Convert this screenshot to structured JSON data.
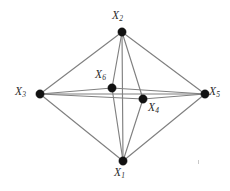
{
  "figure": {
    "type": "undirected-graph-diagram",
    "background_color": "#ffffff",
    "edge_color": "#808080",
    "node_color": "#111111",
    "label_color": "#2b2b2b",
    "width": 230,
    "height": 191
  },
  "nodes": [
    {
      "id": "X1",
      "label_var": "X",
      "label_sub": "1",
      "label_text": "X1",
      "x": 123,
      "y": 161,
      "r": 4.2,
      "label_x": 114,
      "label_y": 167
    },
    {
      "id": "X2",
      "label_var": "X",
      "label_sub": "2",
      "label_text": "X2",
      "x": 122,
      "y": 32,
      "r": 4.2,
      "label_x": 112,
      "label_y": 10
    },
    {
      "id": "X3",
      "label_var": "X",
      "label_sub": "3",
      "label_text": "X3",
      "x": 40,
      "y": 94,
      "r": 4.2,
      "label_x": 15,
      "label_y": 86
    },
    {
      "id": "X4",
      "label_var": "X",
      "label_sub": "4",
      "label_text": "X4",
      "x": 143,
      "y": 99,
      "r": 4.2,
      "label_x": 148,
      "label_y": 102
    },
    {
      "id": "X5",
      "label_var": "X",
      "label_sub": "5",
      "label_text": "X5",
      "x": 205,
      "y": 94,
      "r": 4.2,
      "label_x": 209,
      "label_y": 86
    },
    {
      "id": "X6",
      "label_var": "X",
      "label_sub": "6",
      "label_text": "X6",
      "x": 112,
      "y": 88,
      "r": 4.2,
      "label_x": 95,
      "label_y": 69
    }
  ],
  "edges": [
    {
      "from": "X3",
      "to": "X2"
    },
    {
      "from": "X2",
      "to": "X5"
    },
    {
      "from": "X3",
      "to": "X1"
    },
    {
      "from": "X1",
      "to": "X5"
    },
    {
      "from": "X3",
      "to": "X6"
    },
    {
      "from": "X6",
      "to": "X5"
    },
    {
      "from": "X3",
      "to": "X4"
    },
    {
      "from": "X4",
      "to": "X5"
    },
    {
      "from": "X3",
      "to": "X5"
    },
    {
      "from": "X2",
      "to": "X6"
    },
    {
      "from": "X6",
      "to": "X1"
    },
    {
      "from": "X2",
      "to": "X4"
    },
    {
      "from": "X4",
      "to": "X1"
    },
    {
      "from": "X2",
      "to": "X1"
    }
  ],
  "artifacts": [
    {
      "name": "speck",
      "x": 198,
      "y": 160
    }
  ]
}
